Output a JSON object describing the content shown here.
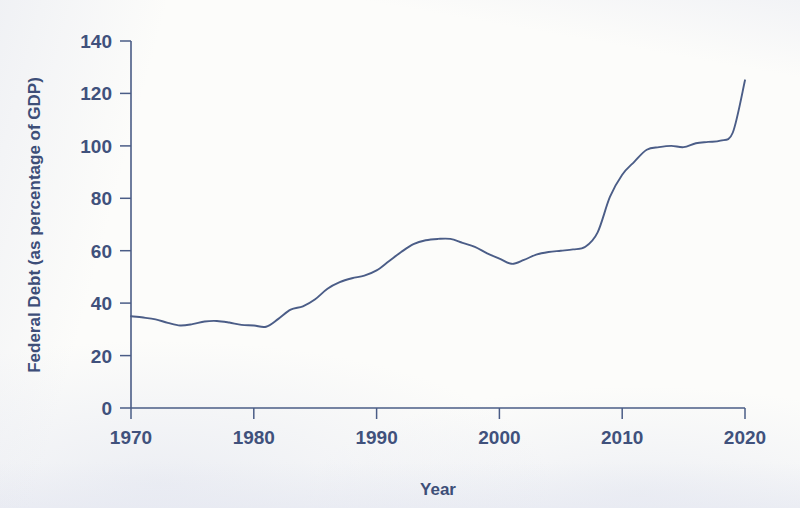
{
  "chart_data": {
    "type": "line",
    "title": "",
    "xlabel": "Year",
    "ylabel": "Federal Debt (as percentage of GDP)",
    "xlim": [
      1970,
      2020
    ],
    "ylim": [
      0,
      140
    ],
    "xticks": [
      "1970",
      "1980",
      "1990",
      "2000",
      "2010",
      "2020"
    ],
    "yticks": [
      "0",
      "20",
      "40",
      "60",
      "80",
      "100",
      "120",
      "140"
    ],
    "grid": false,
    "legend": "none",
    "line_color": "#4b5d87",
    "axis_color": "#4a5c86",
    "background_color": "#fcfcfa",
    "series": [
      {
        "name": "Federal Debt (as percentage of GDP)",
        "x": [
          1970,
          1971,
          1972,
          1973,
          1974,
          1975,
          1976,
          1977,
          1978,
          1979,
          1980,
          1981,
          1982,
          1983,
          1984,
          1985,
          1986,
          1987,
          1988,
          1989,
          1990,
          1991,
          1992,
          1993,
          1994,
          1995,
          1996,
          1997,
          1998,
          1999,
          2000,
          2001,
          2002,
          2003,
          2004,
          2005,
          2006,
          2007,
          2008,
          2009,
          2010,
          2011,
          2012,
          2013,
          2014,
          2015,
          2016,
          2017,
          2018,
          2019,
          2020
        ],
        "values": [
          35,
          34.5,
          33.8,
          32.5,
          31.5,
          32,
          33,
          33.2,
          32.6,
          31.7,
          31.5,
          31,
          34,
          37.5,
          38.8,
          41.5,
          45.5,
          48,
          49.5,
          50.5,
          52.5,
          56,
          59.5,
          62.5,
          64,
          64.5,
          64.5,
          63,
          61.5,
          59,
          57,
          55,
          56.5,
          58.5,
          59.5,
          60,
          60.5,
          61.5,
          67,
          80.5,
          89,
          94,
          98.5,
          99.5,
          100,
          99.5,
          101,
          101.5,
          102,
          105,
          125
        ]
      }
    ]
  }
}
